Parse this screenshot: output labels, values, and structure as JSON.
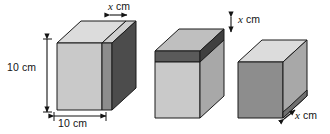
{
  "figure": {
    "kind": "geometry-diagram",
    "background_color": "#ffffff"
  },
  "labels": {
    "x_top_first": {
      "var": "x",
      "unit": "cm",
      "text": "x cm"
    },
    "height_first": {
      "value": "10",
      "unit": "cm",
      "text": "10 cm"
    },
    "width_first": {
      "value": "10",
      "unit": "cm",
      "text": "10 cm"
    },
    "x_top_second": {
      "var": "x",
      "unit": "cm",
      "text": "x cm"
    },
    "x_bottom_third": {
      "var": "x",
      "unit": "cm",
      "text": "x cm"
    }
  },
  "colors": {
    "front_light": "#c9c9c9",
    "front_mid": "#b0b0b0",
    "front_dark": "#8d8d8d",
    "top_light": "#dcdcdc",
    "top_mid": "#bfbfbf",
    "side_dark": "#4c4c4c",
    "side_mid": "#8a8a8a",
    "slab_dark": "#5a5a5a",
    "outline": "#1a1a1a",
    "text": "#141414"
  },
  "shapes": [
    {
      "name": "prism-vertical-slice",
      "order": 1,
      "note": "10 cm cube with a vertical slice of thickness x cm on the right face",
      "dimension_labels": [
        "10 cm",
        "10 cm",
        "x cm"
      ]
    },
    {
      "name": "prism-horizontal-slab",
      "order": 2,
      "note": "cube with a horizontal slab of thickness x cm across the top",
      "dimension_labels": [
        "x cm"
      ]
    },
    {
      "name": "prism-depth-slice",
      "order": 3,
      "note": "cube with a slice of thickness x cm in the depth direction",
      "dimension_labels": [
        "x cm"
      ]
    }
  ],
  "dimension_arrows": [
    {
      "name": "x-arrow-top-first",
      "orientation": "horizontal",
      "double_headed": true
    },
    {
      "name": "height-arrow-first",
      "orientation": "vertical",
      "double_headed": true
    },
    {
      "name": "width-arrow-first",
      "orientation": "horizontal",
      "double_headed": true
    },
    {
      "name": "x-arrow-top-second",
      "orientation": "vertical",
      "double_headed": true
    },
    {
      "name": "x-arrow-bottom-third",
      "orientation": "diagonal",
      "double_headed": true
    }
  ]
}
